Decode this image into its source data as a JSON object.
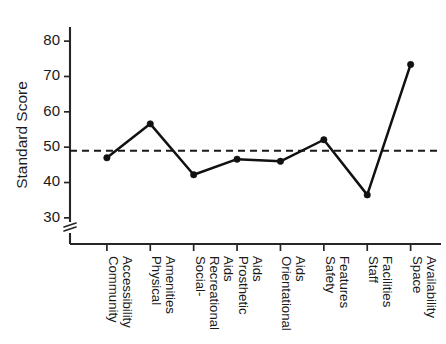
{
  "chart_data": {
    "type": "line",
    "title": "",
    "subtitle": "",
    "xlabel": "",
    "ylabel": "Standard Score",
    "categories": [
      "Community Accessibility",
      "Physical Amenities",
      "Social-Recreational Aids",
      "Prosthetic Aids",
      "Orientational Aids",
      "Safety Features",
      "Staff Facilities",
      "Space Availability"
    ],
    "category_lines": [
      [
        "Community",
        "Accessibility"
      ],
      [
        "Physical",
        "Amenities"
      ],
      [
        "Social-",
        "Recreational",
        "Aids"
      ],
      [
        "Prosthetic",
        "Aids"
      ],
      [
        "Orientational",
        "Aids"
      ],
      [
        "Safety",
        "Features"
      ],
      [
        "Staff",
        "Facilities"
      ],
      [
        "Space",
        "Availability"
      ]
    ],
    "values": [
      47.0,
      56.6,
      42.2,
      46.6,
      46.0,
      52.1,
      36.5,
      73.4
    ],
    "series": [
      {
        "name": "Standard Score",
        "values": [
          47.0,
          56.6,
          42.2,
          46.6,
          46.0,
          52.1,
          36.5,
          73.4
        ]
      }
    ],
    "ylim": [
      26,
      84
    ],
    "yticks": [
      30,
      40,
      50,
      60,
      70,
      80
    ],
    "ytick_labels": [
      "30",
      "40",
      "50",
      "60",
      "70",
      "80"
    ],
    "axis_break": true,
    "axis_break_note": "zigzag break on y-axis below 30",
    "reference_line": {
      "value": 49.0,
      "style": "dashed",
      "label": ""
    },
    "grid": false,
    "legend": false,
    "legend_position": "none",
    "marker": "filled-circle",
    "colors": {
      "line": "#111111",
      "marker": "#111111",
      "axis": "#262626",
      "reference": "#1a1a1a",
      "background": "#ffffff"
    }
  }
}
